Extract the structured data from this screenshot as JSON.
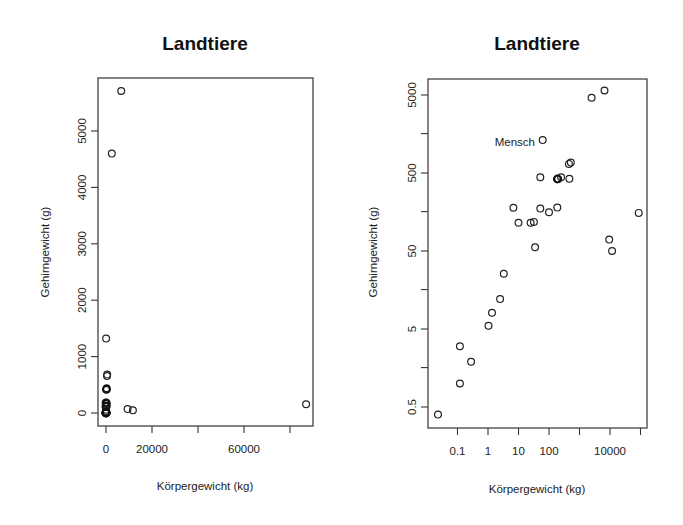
{
  "chart_data": [
    {
      "type": "scatter",
      "title": "Landtiere",
      "xlabel": "Körpergewicht (kg)",
      "ylabel": "Gehirngewicht (g)",
      "x_scale": "linear",
      "y_scale": "linear",
      "xlim": [
        -3500,
        90000
      ],
      "ylim": [
        -250,
        5900
      ],
      "xticks": [
        0,
        20000,
        40000,
        60000,
        80000
      ],
      "xtick_labels": [
        "0",
        "20000",
        "",
        "60000",
        ""
      ],
      "yticks": [
        0,
        1000,
        2000,
        3000,
        4000,
        5000
      ],
      "ytick_labels": [
        "0",
        "1000",
        "2000",
        "3000",
        "4000",
        "5000"
      ],
      "grid": false,
      "legend": null,
      "points": [
        {
          "x": 2500,
          "y": 4600
        },
        {
          "x": 6600,
          "y": 5710
        },
        {
          "x": 62,
          "y": 1320
        },
        {
          "x": 450,
          "y": 655
        },
        {
          "x": 520,
          "y": 680
        },
        {
          "x": 200,
          "y": 420
        },
        {
          "x": 250,
          "y": 440
        },
        {
          "x": 187,
          "y": 419
        },
        {
          "x": 36,
          "y": 120
        },
        {
          "x": 100,
          "y": 157
        },
        {
          "x": 52,
          "y": 180
        },
        {
          "x": 160,
          "y": 169
        },
        {
          "x": 28,
          "y": 115
        },
        {
          "x": 10,
          "y": 115
        },
        {
          "x": 6.8,
          "y": 179
        },
        {
          "x": 35,
          "y": 56
        },
        {
          "x": 3.3,
          "y": 25.6
        },
        {
          "x": 2.5,
          "y": 12.1
        },
        {
          "x": 1.35,
          "y": 8.1
        },
        {
          "x": 1.04,
          "y": 5.5
        },
        {
          "x": 0.28,
          "y": 1.9
        },
        {
          "x": 0.12,
          "y": 3.0
        },
        {
          "x": 0.12,
          "y": 1.0
        },
        {
          "x": 0.023,
          "y": 0.4
        },
        {
          "x": 9400,
          "y": 70
        },
        {
          "x": 11700,
          "y": 50
        },
        {
          "x": 87000,
          "y": 154
        }
      ]
    },
    {
      "type": "scatter",
      "title": "Landtiere",
      "xlabel": "Körpergewicht (kg)",
      "ylabel": "Gehirngewicht (g)",
      "x_scale": "log",
      "y_scale": "log",
      "xlim": [
        0.016,
        160000
      ],
      "ylim": [
        0.28,
        7900
      ],
      "xticks": [
        0.1,
        1,
        10,
        100,
        1000,
        10000,
        100000
      ],
      "xtick_labels": [
        "0.1",
        "1",
        "10",
        "100",
        "",
        "10000",
        ""
      ],
      "yticks": [
        0.5,
        1.6,
        5,
        16,
        50,
        160,
        500,
        1600,
        5000
      ],
      "ytick_labels": [
        "0.5",
        "",
        "5",
        "",
        "50",
        "",
        "500",
        "",
        "5000"
      ],
      "grid": false,
      "legend": null,
      "annotations": [
        {
          "text": "Mensch",
          "x": 62,
          "y": 1320
        }
      ],
      "points": [
        {
          "x": 2500,
          "y": 4600
        },
        {
          "x": 6600,
          "y": 5710
        },
        {
          "x": 62,
          "y": 1320,
          "label": "Mensch"
        },
        {
          "x": 450,
          "y": 655
        },
        {
          "x": 520,
          "y": 680
        },
        {
          "x": 200,
          "y": 420
        },
        {
          "x": 250,
          "y": 440
        },
        {
          "x": 187,
          "y": 419
        },
        {
          "x": 52,
          "y": 440
        },
        {
          "x": 465,
          "y": 423
        },
        {
          "x": 6.8,
          "y": 179
        },
        {
          "x": 52,
          "y": 175
        },
        {
          "x": 100,
          "y": 157
        },
        {
          "x": 187,
          "y": 180
        },
        {
          "x": 10,
          "y": 115
        },
        {
          "x": 25,
          "y": 115
        },
        {
          "x": 32,
          "y": 118
        },
        {
          "x": 35,
          "y": 56
        },
        {
          "x": 9400,
          "y": 70
        },
        {
          "x": 11700,
          "y": 50
        },
        {
          "x": 87000,
          "y": 154
        },
        {
          "x": 3.3,
          "y": 25.6
        },
        {
          "x": 2.5,
          "y": 12.1
        },
        {
          "x": 1.35,
          "y": 8.1
        },
        {
          "x": 1.04,
          "y": 5.5
        },
        {
          "x": 0.12,
          "y": 3.0
        },
        {
          "x": 0.28,
          "y": 1.9
        },
        {
          "x": 0.12,
          "y": 1.0
        },
        {
          "x": 0.023,
          "y": 0.4
        }
      ]
    }
  ],
  "plots": [
    {
      "title": "Landtiere",
      "xlabel": "Körpergewicht (kg)",
      "ylabel": "Gehirngewicht (g)",
      "xtick_labels": [
        "0",
        "20000",
        "60000"
      ],
      "ytick_labels": [
        "0",
        "1000",
        "2000",
        "3000",
        "4000",
        "5000"
      ]
    },
    {
      "title": "Landtiere",
      "xlabel": "Körpergewicht (kg)",
      "ylabel": "Gehirngewicht (g)",
      "xtick_labels": [
        "0.1",
        "1",
        "10",
        "100",
        "10000"
      ],
      "ytick_labels": [
        "0.5",
        "5",
        "50",
        "500",
        "5000"
      ],
      "annotation": "Mensch"
    }
  ]
}
